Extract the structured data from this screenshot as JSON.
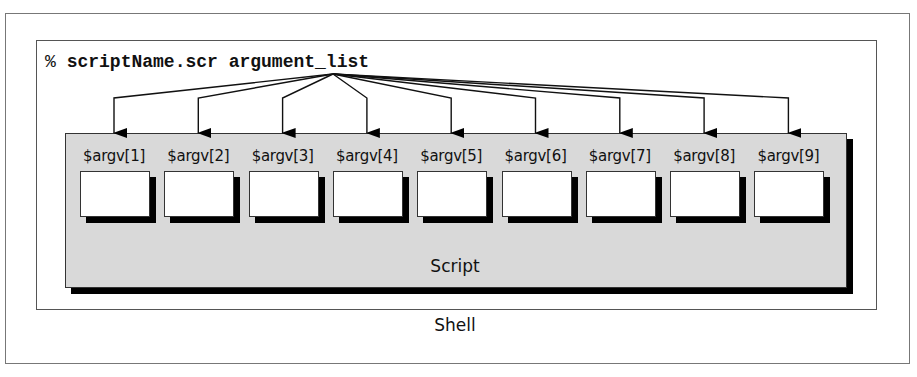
{
  "command": {
    "prompt": "%",
    "text": "scriptName.scr argument_list"
  },
  "arguments": [
    {
      "label": "$argv[1]"
    },
    {
      "label": "$argv[2]"
    },
    {
      "label": "$argv[3]"
    },
    {
      "label": "$argv[4]"
    },
    {
      "label": "$argv[5]"
    },
    {
      "label": "$argv[6]"
    },
    {
      "label": "$argv[7]"
    },
    {
      "label": "$argv[8]"
    },
    {
      "label": "$argv[9]"
    }
  ],
  "script_label": "Script",
  "shell_label": "Shell",
  "colors": {
    "script_fill": "#d9d9d9",
    "shadow": "#000000",
    "arg_box_fill": "#ffffff"
  }
}
